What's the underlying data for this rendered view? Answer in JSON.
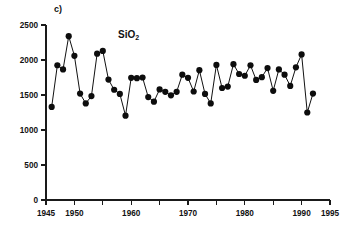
{
  "figure": {
    "panel_label": "c)",
    "series_name": "SiO",
    "series_name_subscript": "2"
  },
  "chart_data": {
    "type": "line",
    "title": "SiO2",
    "panel": "c)",
    "xlabel": "",
    "ylabel": "",
    "xlim": [
      1945,
      1995
    ],
    "ylim": [
      0,
      2500
    ],
    "grid": false,
    "legend": null,
    "xticks": [
      1945,
      1950,
      1955,
      1960,
      1965,
      1970,
      1975,
      1980,
      1985,
      1990,
      1995
    ],
    "xtick_labels": [
      "1945",
      "1950",
      "",
      "1960",
      "",
      "1970",
      "",
      "1980",
      "",
      "1990",
      "1995"
    ],
    "yticks": [
      0,
      500,
      1000,
      1500,
      2000,
      2500
    ],
    "ytick_labels": [
      "0",
      "500",
      "1000",
      "1500",
      "2000",
      "2500"
    ],
    "marker": "filled-circle",
    "x": [
      1946,
      1947,
      1948,
      1949,
      1950,
      1951,
      1952,
      1953,
      1954,
      1955,
      1956,
      1957,
      1958,
      1959,
      1960,
      1961,
      1962,
      1963,
      1964,
      1965,
      1966,
      1967,
      1968,
      1969,
      1970,
      1971,
      1972,
      1973,
      1974,
      1975,
      1976,
      1977,
      1978,
      1979,
      1980,
      1981,
      1982,
      1983,
      1984,
      1985,
      1986,
      1987,
      1988,
      1989,
      1990,
      1991,
      1992
    ],
    "values": [
      1330,
      1925,
      1865,
      2340,
      2060,
      1520,
      1380,
      1485,
      2090,
      2130,
      1720,
      1575,
      1515,
      1205,
      1745,
      1740,
      1750,
      1470,
      1405,
      1580,
      1545,
      1495,
      1545,
      1790,
      1745,
      1550,
      1855,
      1515,
      1380,
      1930,
      1600,
      1620,
      1940,
      1800,
      1775,
      1925,
      1715,
      1755,
      1885,
      1560,
      1865,
      1790,
      1630,
      1895,
      2080,
      1250,
      1520
    ]
  }
}
